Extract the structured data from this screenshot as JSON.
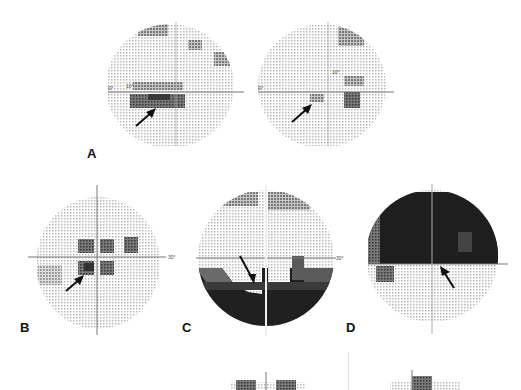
{
  "figure": {
    "type": "visual field grayscale printouts",
    "colors": {
      "background": "#ffffff",
      "normal_field": "#d8d8d8",
      "mild_defect": "#9a9a9a",
      "moderate_defect": "#5e5e5e",
      "dense_defect": "#1e1e1e",
      "axis": "#777777",
      "arrow": "#111111"
    },
    "panels": [
      {
        "id": "A",
        "label": "A",
        "fields": [
          {
            "name": "A-left",
            "axis_label": "30°",
            "inner_label": "10°",
            "arrow": "pointing to inferior paracentral defect"
          },
          {
            "name": "A-right",
            "axis_label": "30°",
            "inner_label": "10°",
            "arrow": "pointing to inferior paracentral defect"
          }
        ]
      },
      {
        "id": "B",
        "label": "B",
        "fields": [
          {
            "name": "B",
            "axis_label": "30°",
            "arrow": "pointing to paracentral scotoma"
          }
        ]
      },
      {
        "id": "C",
        "label": "C",
        "fields": [
          {
            "name": "C",
            "axis_label": "30°",
            "arrow": "pointing to inferior altitudinal defect edge"
          }
        ]
      },
      {
        "id": "D",
        "label": "D",
        "fields": [
          {
            "name": "D",
            "axis_label": "30°",
            "arrow": "pointing to superior altitudinal defect edge"
          }
        ]
      },
      {
        "id": "E",
        "label": "",
        "fields": [
          {
            "name": "bottom-left-partial"
          },
          {
            "name": "bottom-right-partial"
          }
        ]
      }
    ],
    "labels": {
      "A": "A",
      "B": "B",
      "C": "C",
      "D": "D",
      "deg30": "30°",
      "deg10": "10°"
    }
  }
}
